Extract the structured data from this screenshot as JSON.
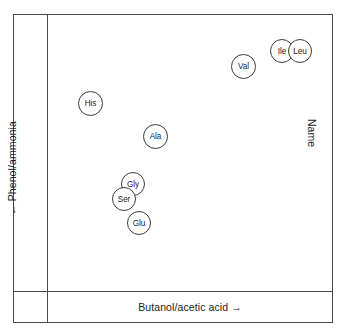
{
  "chart_data": {
    "type": "scatter",
    "title": "",
    "xlabel": "Butanol/acetic acid →",
    "ylabel": "← Phenol/ammonia",
    "legend_label": "Name",
    "legend_position": "right",
    "grid": false,
    "xlim": [
      0,
      100
    ],
    "ylim": [
      0,
      100
    ],
    "tick_labels": {
      "x": [],
      "y": []
    },
    "points": [
      {
        "label": "Val",
        "x": 69.6,
        "y": 79.2
      },
      {
        "label": "Ile",
        "x": 85.2,
        "y": 85.3
      },
      {
        "label": "Leu",
        "x": 92.2,
        "y": 85.3
      },
      {
        "label": "His",
        "x": 16.4,
        "y": 64.5
      },
      {
        "label": "Ala",
        "x": 38.6,
        "y": 51.4
      },
      {
        "label": "Gly",
        "x": 32.4,
        "y": 37.6
      },
      {
        "label": "Ser",
        "x": 28.6,
        "y": 31.8
      },
      {
        "label": "Glu",
        "x": 34.4,
        "y": 23.8
      }
    ]
  },
  "axes": {
    "x_label": "Butanol/acetic acid →",
    "y_label": "← Phenol/ammonia"
  },
  "legend": {
    "title": "Name"
  },
  "markers": [
    {
      "name": "marker-val",
      "label": "Val",
      "left": 231,
      "top": 54,
      "size": 25
    },
    {
      "name": "marker-ile",
      "label": "Ile",
      "left": 270,
      "top": 39,
      "size": 24
    },
    {
      "name": "marker-leu",
      "label": "Leu",
      "left": 288,
      "top": 39,
      "size": 24
    },
    {
      "name": "marker-his",
      "label": "His",
      "left": 78,
      "top": 91,
      "size": 25
    },
    {
      "name": "marker-ala",
      "label": "Ala",
      "left": 143,
      "top": 124,
      "size": 25
    },
    {
      "name": "marker-gly",
      "label": "Gly",
      "left": 121,
      "top": 172,
      "size": 24
    },
    {
      "name": "marker-ser",
      "label": "Ser",
      "left": 112,
      "top": 187,
      "size": 24
    },
    {
      "name": "marker-glu",
      "label": "Glu",
      "left": 127,
      "top": 211,
      "size": 24
    }
  ],
  "colors": {
    "frame": "#4a4a4a",
    "marker_stroke": "#3a3a3a",
    "text": "#1c1c1c",
    "background": "#ffffff"
  }
}
